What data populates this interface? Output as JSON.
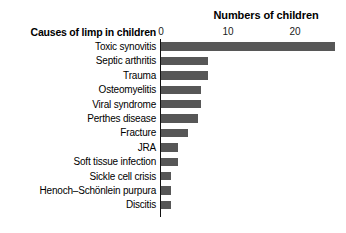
{
  "chart_data": {
    "type": "bar",
    "orientation": "horizontal",
    "title": "Numbers of children",
    "xlabel": "Numbers of children",
    "ylabel": "Causes of limp in children",
    "categories": [
      "Toxic synovitis",
      "Septic arthritis",
      "Trauma",
      "Osteomyelitis",
      "Viral syndrome",
      "Perthes disease",
      "Fracture",
      "JRA",
      "Soft tissue infection",
      "Sickle cell crisis",
      "Henoch–Schönlein purpura",
      "Discitis"
    ],
    "values": [
      26,
      7,
      7,
      6,
      6,
      5.5,
      4,
      2.5,
      2.5,
      1.5,
      1.5,
      1.5
    ],
    "xlim": [
      0,
      28
    ],
    "xticks": [
      0,
      10,
      20
    ],
    "xtick_labels": [
      "0",
      "10",
      "20"
    ],
    "grid": false,
    "legend": false,
    "bar_color": "#575757",
    "axis_color": "#111111"
  },
  "chart": {
    "title": "Numbers of children",
    "category_axis_title": "Causes of limp in children"
  }
}
